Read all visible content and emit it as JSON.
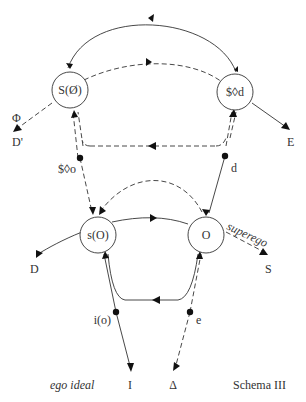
{
  "diagram": {
    "title": "Schema III",
    "caption_left": "ego ideal",
    "nodes": {
      "top_left": "S(Ø)",
      "top_right": "$◊d",
      "bottom_left": "s(O)",
      "bottom_right": "O"
    },
    "points": {
      "upper_left": "$◊o",
      "upper_right": "d",
      "lower_left": "i(o)",
      "lower_right": "e"
    },
    "terminals": {
      "phi": "Φ",
      "d_prime": "D'",
      "e_upper": "E",
      "d_lower": "D",
      "s_lower": "S",
      "i_bottom": "I",
      "delta_bottom": "Δ"
    },
    "edge_labels": {
      "superego": "superego"
    }
  }
}
